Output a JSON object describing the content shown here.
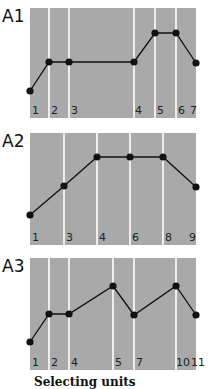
{
  "caption": "Selecting units",
  "colors": {
    "panel": "#a9a9a9",
    "divider": "#ffffff",
    "line": "#111111"
  },
  "chart_data": [
    {
      "type": "line",
      "title": "A1",
      "panel": {
        "x": 30,
        "y": 8,
        "w": 166,
        "h": 110
      },
      "dividers_x": [
        49,
        69,
        134,
        155,
        176
      ],
      "labels": [
        {
          "text": "1",
          "x": 32
        },
        {
          "text": "2",
          "x": 51
        },
        {
          "text": "3",
          "x": 71
        },
        {
          "text": "4",
          "x": 135
        },
        {
          "text": "5",
          "x": 157
        },
        {
          "text": "6",
          "x": 178
        },
        {
          "text": "7",
          "x": 190
        }
      ],
      "points": [
        [
          30,
          91
        ],
        [
          49,
          62
        ],
        [
          69,
          62
        ],
        [
          134,
          62
        ],
        [
          155,
          33
        ],
        [
          176,
          33
        ],
        [
          196,
          63
        ]
      ],
      "relative_levels": [
        1,
        2,
        2,
        2,
        3,
        3,
        2
      ]
    },
    {
      "type": "line",
      "title": "A2",
      "panel": {
        "x": 30,
        "y": 133,
        "w": 166,
        "h": 112
      },
      "dividers_x": [
        64,
        97,
        130,
        163
      ],
      "labels": [
        {
          "text": "1",
          "x": 32
        },
        {
          "text": "3",
          "x": 66
        },
        {
          "text": "4",
          "x": 99
        },
        {
          "text": "6",
          "x": 132
        },
        {
          "text": "8",
          "x": 165
        },
        {
          "text": "9",
          "x": 189
        }
      ],
      "points": [
        [
          30,
          215
        ],
        [
          64,
          186
        ],
        [
          97,
          157
        ],
        [
          130,
          157
        ],
        [
          163,
          157
        ],
        [
          196,
          187
        ]
      ],
      "relative_levels": [
        1,
        2,
        3,
        3,
        3,
        2
      ]
    },
    {
      "type": "line",
      "title": "A3",
      "panel": {
        "x": 30,
        "y": 258,
        "w": 166,
        "h": 112
      },
      "dividers_x": [
        49,
        69,
        113,
        134,
        176
      ],
      "labels": [
        {
          "text": "1",
          "x": 32
        },
        {
          "text": "2",
          "x": 51
        },
        {
          "text": "4",
          "x": 71
        },
        {
          "text": "5",
          "x": 115
        },
        {
          "text": "7",
          "x": 136
        },
        {
          "text": "10",
          "x": 176
        },
        {
          "text": "11",
          "x": 191
        }
      ],
      "points": [
        [
          30,
          342
        ],
        [
          49,
          314
        ],
        [
          69,
          314
        ],
        [
          113,
          286
        ],
        [
          134,
          315
        ],
        [
          176,
          286
        ],
        [
          196,
          315
        ]
      ],
      "relative_levels": [
        1,
        2,
        2,
        3,
        2,
        3,
        2
      ]
    }
  ]
}
